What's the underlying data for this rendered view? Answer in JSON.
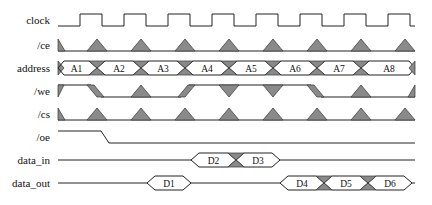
{
  "diagram": {
    "type": "timing-diagram",
    "signals": [
      {
        "name": "clock",
        "y": 20
      },
      {
        "name": "/ce",
        "y": 45
      },
      {
        "name": "address",
        "y": 68
      },
      {
        "name": "/we",
        "y": 91
      },
      {
        "name": "/cs",
        "y": 114
      },
      {
        "name": "/oe",
        "y": 137
      },
      {
        "name": "data_in",
        "y": 160
      },
      {
        "name": "data_out",
        "y": 183
      }
    ],
    "address_values": [
      "A1",
      "A2",
      "A3",
      "A4",
      "A5",
      "A6",
      "A7",
      "A8"
    ],
    "data_in_values": [
      "D2",
      "D3"
    ],
    "data_out_values": [
      "D1",
      "D4",
      "D5",
      "D6"
    ],
    "colors": {
      "line": "#222222",
      "fill": "#8a8a8a"
    }
  }
}
